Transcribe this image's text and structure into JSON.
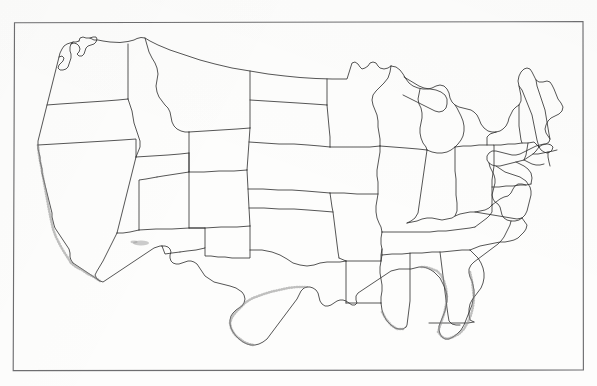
{
  "document": {
    "kind": "scanned-blank-outline-map",
    "title": "Blank United States Map",
    "visible_text": [],
    "background_color": "#fdfdfc",
    "frame_color": "#6e6e70",
    "boundary_color": "#2b2b2b",
    "stipple_color": "#8d8d8d"
  },
  "frame": {
    "name": "map-border-rectangle",
    "corners": {
      "top_left": [
        14,
        22
      ],
      "top_right": [
        583,
        22
      ],
      "bottom_right": [
        583,
        370
      ],
      "bottom_left": [
        13,
        370
      ]
    },
    "skewed": true
  },
  "map": {
    "region": "Contiguous United States",
    "projection_look": "conic",
    "features_shown": [
      "state-boundaries",
      "national-outline",
      "coastline-stipple",
      "great-lakes-outline"
    ],
    "labels_shown": false,
    "states_outlined": [
      "Washington",
      "Oregon",
      "California",
      "Idaho",
      "Nevada",
      "Utah",
      "Arizona",
      "Montana",
      "Wyoming",
      "Colorado",
      "New Mexico",
      "North Dakota",
      "South Dakota",
      "Nebraska",
      "Kansas",
      "Oklahoma",
      "Texas",
      "Minnesota",
      "Iowa",
      "Missouri",
      "Arkansas",
      "Louisiana",
      "Wisconsin",
      "Illinois",
      "Michigan",
      "Indiana",
      "Ohio",
      "Kentucky",
      "Tennessee",
      "Mississippi",
      "Alabama",
      "Georgia",
      "Florida",
      "South Carolina",
      "North Carolina",
      "Virginia",
      "West Virginia",
      "Maryland",
      "Delaware",
      "Pennsylvania",
      "New Jersey",
      "New York",
      "Connecticut",
      "Rhode Island",
      "Massachusetts",
      "Vermont",
      "New Hampshire",
      "Maine"
    ],
    "state_count": 48,
    "stippled_coastlines": [
      "California Pacific coast",
      "Texas Gulf coast",
      "Florida peninsula",
      "Louisiana delta"
    ],
    "interior_marking": {
      "name": "arizona-lake-stipple",
      "position": [
        141,
        243
      ]
    }
  }
}
